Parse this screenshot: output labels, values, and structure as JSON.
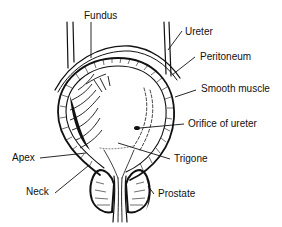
{
  "diagram": {
    "labels": {
      "fundus": "Fundus",
      "ureter": "Ureter",
      "peritoneum": "Peritoneum",
      "smooth_muscle": "Smooth muscle",
      "orifice_of_ureter": "Orifice of ureter",
      "trigone": "Trigone",
      "apex": "Apex",
      "neck": "Neck",
      "prostate": "Prostate"
    },
    "colors": {
      "ink": "#111111",
      "background": "#ffffff"
    }
  }
}
